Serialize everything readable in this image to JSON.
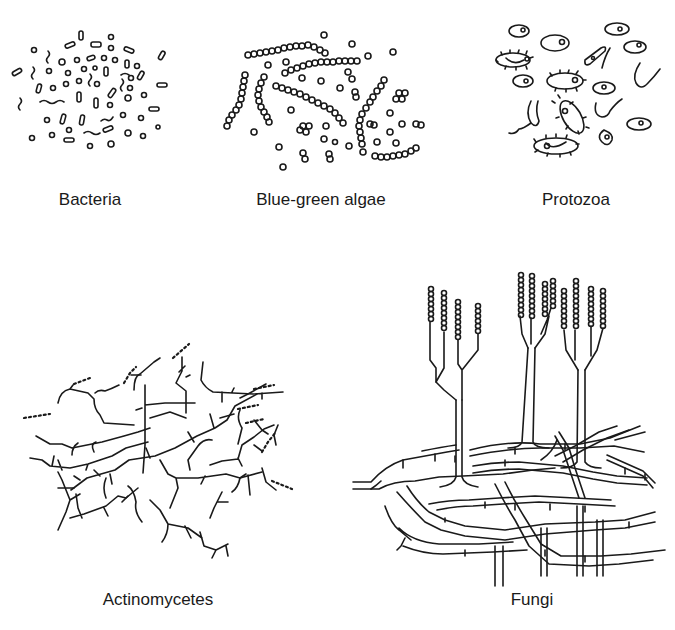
{
  "figure": {
    "panels": [
      {
        "id": "bacteria",
        "label": "Bacteria",
        "icon": "bacteria-illustration"
      },
      {
        "id": "blue-green-algae",
        "label": "Blue-green algae",
        "icon": "blue-green-algae-illustration"
      },
      {
        "id": "protozoa",
        "label": "Protozoa",
        "icon": "protozoa-illustration"
      },
      {
        "id": "actinomycetes",
        "label": "Actinomycetes",
        "icon": "actinomycetes-illustration"
      },
      {
        "id": "fungi",
        "label": "Fungi",
        "icon": "fungi-illustration"
      }
    ]
  }
}
